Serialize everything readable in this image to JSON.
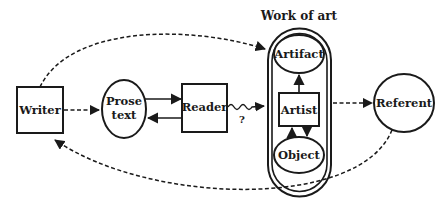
{
  "diagram": {
    "group_title": "Work of art",
    "nodes": {
      "writer": "Writer",
      "prose_line1": "Prose",
      "prose_line2": "text",
      "reader": "Reader",
      "artifact": "Artifact",
      "artist": "Artist",
      "object": "Object",
      "referent": "Referent"
    },
    "edge_labels": {
      "reader_to_work": "?"
    },
    "edges": [
      {
        "from": "Writer",
        "to": "Prose text",
        "style": "dashed"
      },
      {
        "from": "Prose text",
        "to": "Reader",
        "style": "solid"
      },
      {
        "from": "Reader",
        "to": "Prose text",
        "style": "solid"
      },
      {
        "from": "Reader",
        "to": "Work of art",
        "style": "wavy",
        "label": "?"
      },
      {
        "from": "Writer",
        "to": "Work of art",
        "style": "dashed"
      },
      {
        "from": "Work of art",
        "to": "Referent",
        "style": "dashed"
      },
      {
        "from": "Referent",
        "to": "Writer",
        "style": "dashed"
      },
      {
        "from": "Artist",
        "to": "Artifact",
        "style": "solid"
      },
      {
        "from": "Artist",
        "to": "Object",
        "style": "solid"
      },
      {
        "from": "Object",
        "to": "Artist",
        "style": "solid"
      }
    ],
    "colors": {
      "ink": "#1a1a1a",
      "background": "#ffffff"
    }
  }
}
